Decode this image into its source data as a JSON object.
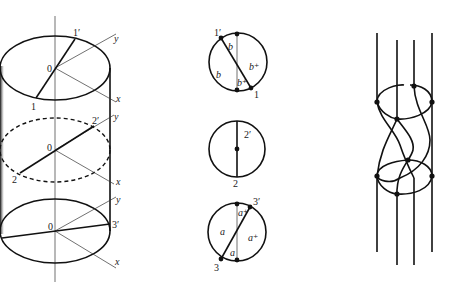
{
  "figure": {
    "panels": [
      {
        "id": "cylinder",
        "description": "Cylinder with three elliptical cross-sections and rotating chords",
        "sections": [
          {
            "level": "top",
            "origin_label": "0",
            "chord_end_label": "1",
            "chord_end_prime_label": "1'",
            "axis_x_label": "x",
            "axis_y_label": "y",
            "style": "solid"
          },
          {
            "level": "middle",
            "origin_label": "0",
            "chord_end_label": "2",
            "chord_end_prime_label": "2'",
            "axis_x_label": "x",
            "axis_y_label": "y",
            "style": "dashed"
          },
          {
            "level": "bottom",
            "origin_label": "0",
            "chord_end_label": "",
            "chord_end_prime_label": "3'",
            "axis_x_label": "x",
            "axis_y_label": "y",
            "style": "solid"
          }
        ]
      },
      {
        "id": "disk-sections",
        "description": "Three disk cross-sections with chord labels",
        "disks": [
          {
            "position": "top",
            "end_label": "1",
            "end_prime_label": "1'",
            "region_labels": [
              "b",
              "b",
              "b+",
              "b+"
            ]
          },
          {
            "position": "middle",
            "end_label": "2",
            "end_prime_label": "2'",
            "region_labels": []
          },
          {
            "position": "bottom",
            "end_label": "3",
            "end_prime_label": "3'",
            "region_labels": [
              "a+",
              "a",
              "a+",
              "a"
            ]
          }
        ]
      },
      {
        "id": "braid",
        "description": "Four-strand braid with two ring crossings",
        "strand_count": 4,
        "ring_count": 2
      }
    ]
  },
  "labels": {
    "cyl_top_0": "0",
    "cyl_top_1": "1",
    "cyl_top_1p": "1′",
    "cyl_top_x": "x",
    "cyl_top_y": "y",
    "cyl_mid_0": "0",
    "cyl_mid_2": "2",
    "cyl_mid_2p": "2′",
    "cyl_mid_x": "x",
    "cyl_mid_y": "y",
    "cyl_bot_0": "0",
    "cyl_bot_3p": "3′",
    "cyl_bot_x": "x",
    "cyl_bot_y": "y",
    "disk1_1p": "1′",
    "disk1_1": "1",
    "disk1_b_top": "b",
    "disk1_b_left": "b",
    "disk1_bplus_right": "b⁺",
    "disk1_bplus_bottom": "b⁺",
    "disk2_2p": "2′",
    "disk2_2": "2",
    "disk3_3p": "3′",
    "disk3_3": "3",
    "disk3_aplus_top": "a⁺",
    "disk3_a_left": "a",
    "disk3_aplus_right": "a⁺",
    "disk3_a_bottom": "a"
  }
}
